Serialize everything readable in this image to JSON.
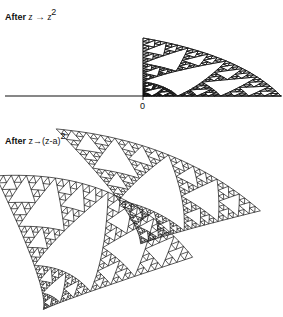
{
  "figure": {
    "top_panel": {
      "label_prefix": "After ",
      "label_map": "z → z",
      "label_exponent": "2",
      "origin_label": "0"
    },
    "bottom_panel": {
      "label_prefix": "After ",
      "label_map": "z→(z-a)",
      "label_exponent": "2"
    },
    "colors": {
      "ink": "#111111",
      "background": "#ffffff"
    },
    "fractal": {
      "type": "sierpinski",
      "depth": 5
    }
  }
}
